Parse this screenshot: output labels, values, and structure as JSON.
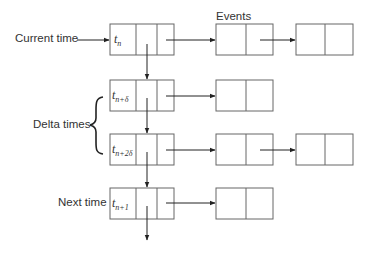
{
  "diagram": {
    "type": "linked-list time queue",
    "labels": {
      "current_time": "Current time",
      "events": "Events",
      "delta_times": "Delta times",
      "next_time": "Next time"
    },
    "time_nodes": [
      {
        "base": "t",
        "sub": "n",
        "events": 2
      },
      {
        "base": "t",
        "sub": "n+δ",
        "events": 1
      },
      {
        "base": "t",
        "sub": "n+2δ",
        "events": 2
      },
      {
        "base": "t",
        "sub": "n+1",
        "events": 1
      }
    ],
    "colors": {
      "line": "#333333",
      "box": "#666666",
      "background": "#ffffff"
    }
  }
}
